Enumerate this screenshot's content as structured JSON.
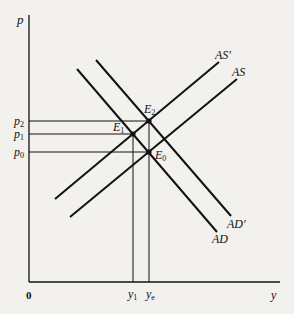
{
  "diagram": {
    "type": "economics-as-ad",
    "axes": {
      "y_label": "p",
      "x_label": "y",
      "origin_label": "0"
    },
    "price_levels": [
      {
        "label": "p",
        "sub": "2",
        "y": 121
      },
      {
        "label": "p",
        "sub": "1",
        "y": 134
      },
      {
        "label": "p",
        "sub": "0",
        "y": 152
      }
    ],
    "output_levels": [
      {
        "label": "y",
        "sub": "1",
        "x": 133
      },
      {
        "label": "y",
        "sub": "e",
        "x": 149
      }
    ],
    "curves": [
      {
        "name": "AS",
        "label": "AS",
        "x1": 70,
        "y1": 217,
        "x2": 237,
        "y2": 79
      },
      {
        "name": "AS-prime",
        "label": "AS'",
        "x1": 55,
        "y1": 199,
        "x2": 219,
        "y2": 62
      },
      {
        "name": "AD",
        "label": "AD",
        "x1": 77,
        "y1": 69,
        "x2": 217,
        "y2": 232
      },
      {
        "name": "AD-prime",
        "label": "AD'",
        "x1": 96,
        "y1": 60,
        "x2": 231,
        "y2": 216
      }
    ],
    "equilibria": [
      {
        "label": "E",
        "sub": "0",
        "x": 149,
        "y": 152
      },
      {
        "label": "E",
        "sub": "1",
        "x": 133,
        "y": 134
      },
      {
        "label": "E",
        "sub": "2",
        "x": 149,
        "y": 121
      }
    ],
    "colors": {
      "background": "#f2f1ee",
      "ink": "#111111"
    }
  }
}
